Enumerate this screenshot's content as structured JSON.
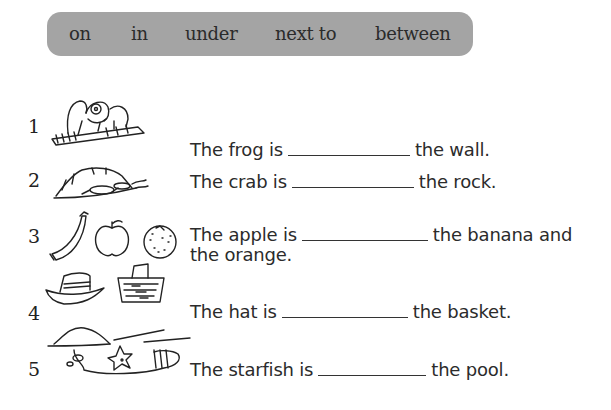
{
  "word_bank": {
    "words": [
      "on",
      "in",
      "under",
      "next to",
      "between"
    ],
    "background_color": "#a4a4a4"
  },
  "exercises": [
    {
      "number": "1",
      "picture": "frog-on-wall-icon",
      "before": "The frog is",
      "after": "the wall."
    },
    {
      "number": "2",
      "picture": "crab-under-rock-icon",
      "before": "The crab is",
      "after": "the rock."
    },
    {
      "number": "3",
      "picture": "banana-apple-orange-icon",
      "before": "The apple is",
      "after": "the banana and",
      "continuation": "the orange."
    },
    {
      "number": "4",
      "picture": "hat-next-to-basket-icon",
      "before": "The hat is",
      "after": "the basket."
    },
    {
      "number": "5",
      "picture": "starfish-in-pool-icon",
      "before": "The starfish is",
      "after": "the pool."
    }
  ]
}
